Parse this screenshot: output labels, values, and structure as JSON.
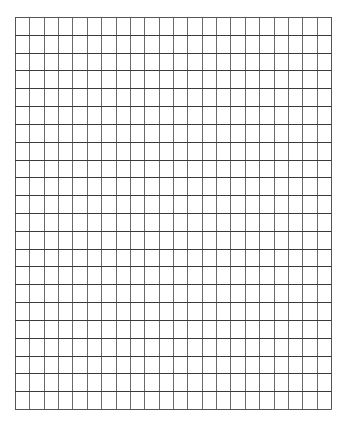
{
  "grid": {
    "columns": 22,
    "rows": 22,
    "left": 15,
    "top": 17,
    "width": 316,
    "height": 392,
    "background": "#ffffff",
    "h_line_color": "#3a3a3a",
    "v_line_color": "#6a6a6a",
    "border_color": "#555555",
    "line_width": 1
  }
}
